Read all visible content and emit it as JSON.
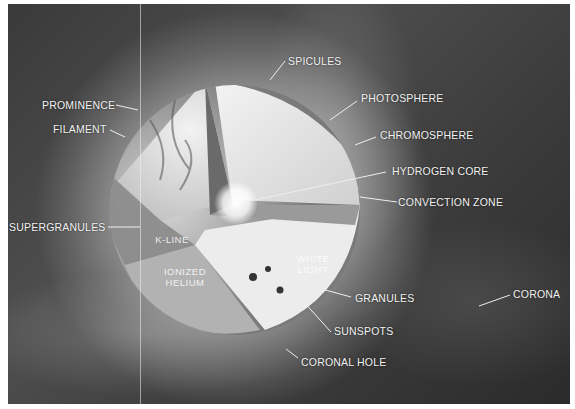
{
  "diagram": {
    "colors": {
      "background": "#3a3a3a",
      "label_text": "#f2f2f2",
      "border": "#ffffff"
    },
    "external_labels": [
      {
        "id": "spicules",
        "text": "SPICULES"
      },
      {
        "id": "photosphere",
        "text": "PHOTOSPHERE"
      },
      {
        "id": "chromosphere",
        "text": "CHROMOSPHERE"
      },
      {
        "id": "hydrogen_core",
        "text": "HYDROGEN CORE"
      },
      {
        "id": "convection_zone",
        "text": "CONVECTION ZONE"
      },
      {
        "id": "prominence",
        "text": "PROMINENCE"
      },
      {
        "id": "filament",
        "text": "FILAMENT"
      },
      {
        "id": "supergranules",
        "text": "SUPERGRANULES"
      },
      {
        "id": "granules",
        "text": "GRANULES"
      },
      {
        "id": "sunspots",
        "text": "SUNSPOTS"
      },
      {
        "id": "coronal_hole",
        "text": "CORONAL HOLE"
      },
      {
        "id": "corona",
        "text": "CORONA"
      }
    ],
    "internal_labels": [
      {
        "id": "k_line",
        "text": "K-LINE"
      },
      {
        "id": "ionized_helium_1",
        "text": "IONIZED"
      },
      {
        "id": "ionized_helium_2",
        "text": "HELIUM"
      },
      {
        "id": "white_light_1",
        "text": "WHITE"
      },
      {
        "id": "white_light_2",
        "text": "LIGHT"
      }
    ]
  }
}
